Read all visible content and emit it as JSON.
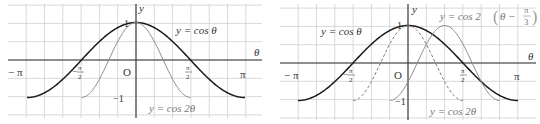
{
  "colors": {
    "grid": "#c8c8c8",
    "axis": "#333333",
    "primary_curve": "#1a1a1a",
    "secondary_curve": "#808080",
    "label": "#333333"
  },
  "chart_data": [
    {
      "type": "line",
      "title": "",
      "xlabel": "θ",
      "ylabel": "y",
      "xlim": [
        -3.1416,
        3.1416
      ],
      "ylim": [
        -1,
        1
      ],
      "grid": true,
      "x_tick_labels": [
        "−π",
        "−π/2",
        "O",
        "π/2",
        "π"
      ],
      "y_tick_labels": [
        "1",
        "−1"
      ],
      "series": [
        {
          "name": "y = cos θ",
          "function": "cos(θ)",
          "domain": [
            -3.1416,
            3.1416
          ],
          "style": "solid-dark"
        },
        {
          "name": "y = cos 2θ",
          "function": "cos(2θ)",
          "domain": [
            -1.5708,
            1.5708
          ],
          "style": "solid-gray"
        }
      ],
      "annotations": [
        {
          "text": "y = cos θ"
        },
        {
          "text": "y = cos 2θ"
        }
      ]
    },
    {
      "type": "line",
      "title": "",
      "xlabel": "θ",
      "ylabel": "y",
      "xlim": [
        -3.1416,
        3.1416
      ],
      "ylim": [
        -1,
        1
      ],
      "grid": true,
      "x_tick_labels": [
        "−π",
        "−π/2",
        "O",
        "π/2",
        "π"
      ],
      "y_tick_labels": [
        "1",
        "−1"
      ],
      "series": [
        {
          "name": "y = cos θ",
          "function": "cos(θ)",
          "domain": [
            -3.1416,
            3.1416
          ],
          "style": "solid-dark"
        },
        {
          "name": "y = cos 2θ",
          "function": "cos(2θ)",
          "domain": [
            -1.5708,
            1.5708
          ],
          "style": "dashed-gray"
        },
        {
          "name": "y = cos 2(θ − π/3)",
          "function": "cos(2(θ − π/3))",
          "domain": [
            -0.5236,
            2.618
          ],
          "style": "solid-gray"
        }
      ],
      "annotations": [
        {
          "text": "y = cos θ"
        },
        {
          "text": "y = cos 2θ"
        },
        {
          "text": "y = cos 2(θ − π/3)"
        }
      ]
    }
  ],
  "left": {
    "axis_theta": "θ",
    "axis_y": "y",
    "tick_neg_pi": "− π",
    "tick_pi": "π",
    "origin": "O",
    "tick_one": "1",
    "tick_neg_one": "−1",
    "half_pi_num": "π",
    "half_pi_den": "2",
    "neg_sign": "−",
    "label_cos": "y = cos θ",
    "label_cos2": "y = cos 2θ"
  },
  "right": {
    "axis_theta": "θ",
    "axis_y": "y",
    "tick_neg_pi": "− π",
    "tick_pi": "π",
    "origin": "O",
    "tick_one": "1",
    "tick_neg_one": "−1",
    "half_pi_num": "π",
    "half_pi_den": "2",
    "neg_sign": "−",
    "label_cos": "y = cos θ",
    "label_cos2": "y = cos 2θ",
    "label_shift_prefix": "y = cos 2",
    "label_shift_theta": "θ −",
    "label_shift_num": "π",
    "label_shift_den": "3"
  }
}
